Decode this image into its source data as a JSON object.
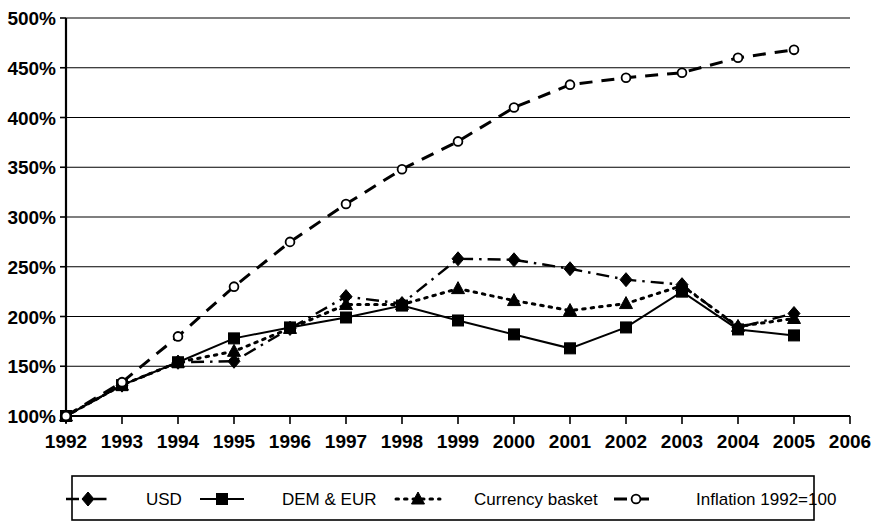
{
  "chart_data": {
    "type": "line",
    "title": "",
    "subtitle": "",
    "xlabel": "",
    "ylabel": "",
    "xlim": [
      1992,
      2006
    ],
    "ylim": [
      100,
      500
    ],
    "ytick_step": 50,
    "grid": true,
    "grid_axis": "y",
    "legend_position": "bottom",
    "x": [
      1992,
      1993,
      1994,
      1995,
      1996,
      1997,
      1998,
      1999,
      2000,
      2001,
      2002,
      2003,
      2004,
      2005
    ],
    "xtick_labels": [
      "1992",
      "1993",
      "1994",
      "1995",
      "1996",
      "1997",
      "1998",
      "1999",
      "2000",
      "2001",
      "2002",
      "2003",
      "2004",
      "2005",
      "2006"
    ],
    "xtick_values": [
      1992,
      1993,
      1994,
      1995,
      1996,
      1997,
      1998,
      1999,
      2000,
      2001,
      2002,
      2003,
      2004,
      2005,
      2006
    ],
    "ytick_labels": [
      "100%",
      "150%",
      "200%",
      "250%",
      "300%",
      "350%",
      "400%",
      "450%",
      "500%"
    ],
    "ytick_values": [
      100,
      150,
      200,
      250,
      300,
      350,
      400,
      450,
      500
    ],
    "series": [
      {
        "name": "USD",
        "marker": "diamond-filled",
        "dash": "dash-dot",
        "values": [
          100,
          131,
          154,
          155,
          188,
          220,
          213,
          258,
          257,
          248,
          237,
          232,
          189,
          203
        ]
      },
      {
        "name": "DEM & EUR",
        "marker": "square-filled",
        "dash": "solid",
        "values": [
          100,
          131,
          154,
          178,
          189,
          199,
          211,
          196,
          182,
          168,
          189,
          225,
          187,
          181
        ]
      },
      {
        "name": "Currency basket",
        "marker": "triangle-filled",
        "dash": "dotted",
        "values": [
          100,
          131,
          154,
          165,
          188,
          212,
          212,
          228,
          216,
          206,
          213,
          231,
          190,
          198
        ]
      },
      {
        "name": "Inflation 1992=100",
        "marker": "circle-open",
        "dash": "dashed",
        "values": [
          100,
          134,
          180,
          230,
          275,
          313,
          348,
          376,
          410,
          433,
          440,
          445,
          460,
          468
        ]
      }
    ]
  },
  "legend": {
    "items": [
      {
        "label": "USD"
      },
      {
        "label": "DEM & EUR"
      },
      {
        "label": "Currency basket"
      },
      {
        "label": "Inflation 1992=100"
      }
    ]
  }
}
